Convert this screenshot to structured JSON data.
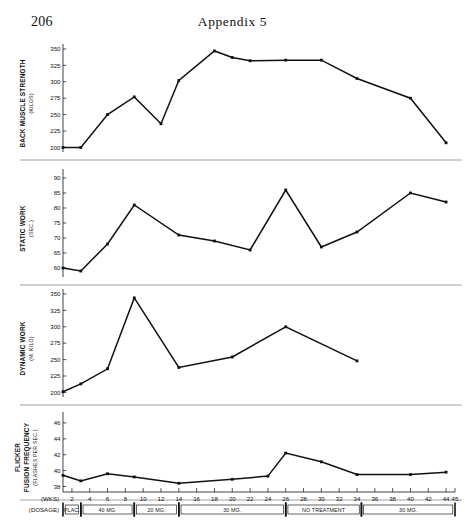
{
  "page": {
    "page_number": "206",
    "running_head": "Appendix 5"
  },
  "chart_data": {
    "type": "line",
    "title": "Appendix 5",
    "xlabel": "(WKS)",
    "dosage_label": "(DOSAGE)",
    "x_ticks": [
      2,
      4,
      6,
      8,
      10,
      12,
      14,
      16,
      18,
      20,
      22,
      24,
      26,
      28,
      30,
      32,
      34,
      36,
      38,
      40,
      42,
      44,
      45
    ],
    "x_range": [
      1,
      45
    ],
    "dosage_periods": [
      {
        "label": "PLAC.",
        "start": 1,
        "end": 3
      },
      {
        "label": "40 MG.",
        "start": 3,
        "end": 9
      },
      {
        "label": "20 MG.",
        "start": 9,
        "end": 14
      },
      {
        "label": "30 MG.",
        "start": 14,
        "end": 26
      },
      {
        "label": "NO TREATMENT",
        "start": 26,
        "end": 34.5
      },
      {
        "label": "30 MG.",
        "start": 34.5,
        "end": 45
      }
    ],
    "panels": [
      {
        "name": "back-muscle-strength",
        "ylabel": "BACK MUSCLE STRENGTH",
        "yunits": "(KILOS)",
        "y_ticks": [
          200,
          225,
          250,
          275,
          300,
          325,
          350
        ],
        "ylim": [
          193,
          353
        ],
        "x": [
          1,
          3,
          6,
          9,
          12,
          14,
          18,
          20,
          22,
          26,
          30,
          34,
          40,
          44
        ],
        "values": [
          200,
          200,
          250,
          277,
          236,
          302,
          347,
          337,
          332,
          333,
          333,
          305,
          275,
          207,
          248,
          258
        ]
      },
      {
        "name": "static-work",
        "ylabel": "STATIC WORK",
        "yunits": "(SEC.)",
        "y_ticks": [
          60,
          65,
          70,
          75,
          80,
          85,
          90
        ],
        "ylim": [
          57,
          92
        ],
        "x": [
          1,
          3,
          6,
          9,
          14,
          18,
          22,
          26,
          30,
          34,
          40,
          44
        ],
        "values": [
          60,
          59,
          68,
          81,
          71,
          69,
          66,
          86,
          67,
          72,
          85,
          82
        ]
      },
      {
        "name": "dynamic-work",
        "ylabel": "DYNAMIC WORK",
        "yunits": "(M. KILO)",
        "y_ticks": [
          200,
          225,
          250,
          275,
          300,
          325,
          350
        ],
        "ylim": [
          193,
          353
        ],
        "x": [
          1,
          3,
          6,
          9,
          14,
          20,
          26,
          34
        ],
        "values": [
          201,
          213,
          236,
          344,
          238,
          254,
          300,
          248
        ]
      },
      {
        "name": "flicker-fusion-frequency",
        "ylabel": "FLICKER",
        "ylabel2": "FUSION FREQUENCY",
        "yunits": "(FLASHES PER SEC.)",
        "y_ticks": [
          38,
          40,
          42,
          44,
          46
        ],
        "ylim": [
          37.3,
          47
        ],
        "x": [
          1,
          3,
          6,
          9,
          14,
          20,
          24,
          26,
          30,
          34,
          40,
          44
        ],
        "values": [
          39.4,
          38.7,
          39.6,
          39.2,
          38.4,
          38.9,
          39.3,
          42.2,
          41.1,
          39.5,
          39.5,
          39.8
        ]
      }
    ]
  }
}
